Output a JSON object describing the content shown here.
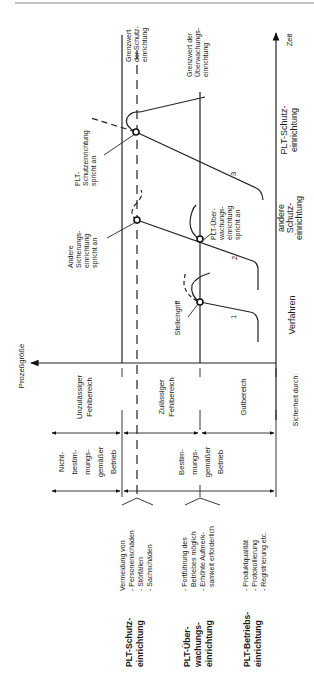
{
  "axes": {
    "time": "Zeit",
    "process_variable": "Prozeßgröße"
  },
  "limits": {
    "protection": [
      "Grenzwert",
      "der Schutz-",
      "einrichtung"
    ],
    "monitoring": [
      "Grenzwert der",
      "Überwachungs-",
      "einrichtung"
    ]
  },
  "events": {
    "plt_protection_triggers": [
      "PLT-",
      "Schutzeinrichtung",
      "spricht an"
    ],
    "other_safety_triggers": [
      "Andere",
      "Sicherungs-",
      "einrichtung",
      "spricht an"
    ],
    "plt_monitoring_triggers": [
      "PLT-Über-",
      "wachungs-",
      "einrichtung",
      "spricht an"
    ],
    "control_action": "Stelleingriff"
  },
  "curves": [
    "1",
    "2",
    "3"
  ],
  "safety_by": {
    "label": "Sicherheit durch:",
    "items": [
      [
        "Verfahren"
      ],
      [
        "andere",
        "Schutz-",
        "einrichtung"
      ],
      [
        "PLT-Schutz-",
        "einrichtung"
      ]
    ]
  },
  "ranges": {
    "impermissible": [
      "Unzulässiger",
      "Fehlbereich"
    ],
    "permissible": [
      "Zulässiger",
      "Fehlbereich"
    ],
    "good": "Gutbereich"
  },
  "operation": {
    "unintended": [
      "Nicht-",
      "bestim-",
      "mungs-",
      "gemäßer",
      "Betrieb"
    ],
    "intended": [
      "Bestim-",
      "mungs-",
      "gemäßer",
      "Betrieb"
    ]
  },
  "legend": [
    {
      "title": [
        "PLT-Schutz-",
        "einrichtung"
      ],
      "desc": [
        "Vermeidung von",
        "- Personenschäden",
        "- Störfällen",
        "- Sachschäden"
      ]
    },
    {
      "title": [
        "PLT-Über-",
        "wachungs-",
        "einrichtung"
      ],
      "desc": [
        "- Fortführung des",
        "  Betriebes möglich",
        "- Erhöhte Aufmerk-",
        "  samkeit erforderlich"
      ]
    },
    {
      "title": [
        "PLT-Betriebs-",
        "einrichtung"
      ],
      "desc": [
        "- Produktqualität",
        "- Protokollierung",
        "- Registrierung etc."
      ]
    }
  ]
}
